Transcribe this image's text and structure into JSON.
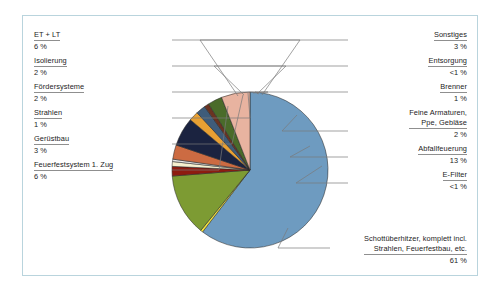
{
  "figure": {
    "background_color": "#ffffff",
    "frame_color": "#b9d4dd",
    "text_color": "#1c1c1c",
    "rule_color": "#8f8f8f",
    "leader_color": "#7a7a7a"
  },
  "chart_data": {
    "type": "pie",
    "title": "",
    "subtitle": "",
    "xlabel": "",
    "ylabel": "",
    "legend_position": "callout-labels",
    "grid": false,
    "units": "%",
    "categories": [
      "Schottüberhitzer, komplett incl. Strahlen, Feuerfestbau, etc.",
      "E-Filter",
      "Abfallfeuerung",
      "Feine Armaturen, Ppe, Gebläse",
      "Brenner",
      "Entsorgung",
      "Sonstiges",
      "ET + LT",
      "Isolierung",
      "Fördersysteme",
      "Strahlen",
      "Gerüstbau",
      "Feuerfestsystem 1. Zug"
    ],
    "values": [
      61,
      0.5,
      13,
      2,
      1,
      0.5,
      3,
      6,
      2,
      2,
      1,
      3,
      6
    ],
    "value_labels": [
      "61 %",
      "<1 %",
      "13 %",
      "2 %",
      "1 %",
      "<1 %",
      "3 %",
      "6 %",
      "2 %",
      "2 %",
      "1 %",
      "3 %",
      "6 %"
    ],
    "colors": [
      "#6e9bc0",
      "#f2e23c",
      "#7d9b33",
      "#8e1c10",
      "#f6f0cf",
      "#e8e8e8",
      "#cc6b42",
      "#1b2340",
      "#e8a033",
      "#3f5c7a",
      "#6b3321",
      "#4a6b2a",
      "#e8b3a0"
    ],
    "slice_start_angle_deg": -90,
    "slice_direction": "clockwise"
  },
  "left_labels": [
    {
      "name": "ET + LT",
      "value": "6 %"
    },
    {
      "name": "Isolierung",
      "value": "2 %"
    },
    {
      "name": "Fördersysteme",
      "value": "2 %"
    },
    {
      "name": "Strahlen",
      "value": "1 %"
    },
    {
      "name": "Gerüstbau",
      "value": "3 %"
    },
    {
      "name": "Feuerfestsystem 1. Zug",
      "value": "6 %"
    }
  ],
  "right_labels": [
    {
      "name": "Sonstiges",
      "value": "3 %"
    },
    {
      "name": "Entsorgung",
      "value": "<1 %"
    },
    {
      "name": "Brenner",
      "value": "1 %"
    },
    {
      "name": "Feine Armaturen,",
      "name2": "Ppe, Gebläse",
      "value": "2 %"
    },
    {
      "name": "Abfallfeuerung",
      "value": "13 %"
    },
    {
      "name": "E-Filter",
      "value": "<1 %"
    }
  ],
  "bottom_right_label": {
    "name": "Schottüberhitzer, komplett incl.",
    "name2": "Strahlen, Feuerfestbau, etc.",
    "value": "61 %"
  }
}
